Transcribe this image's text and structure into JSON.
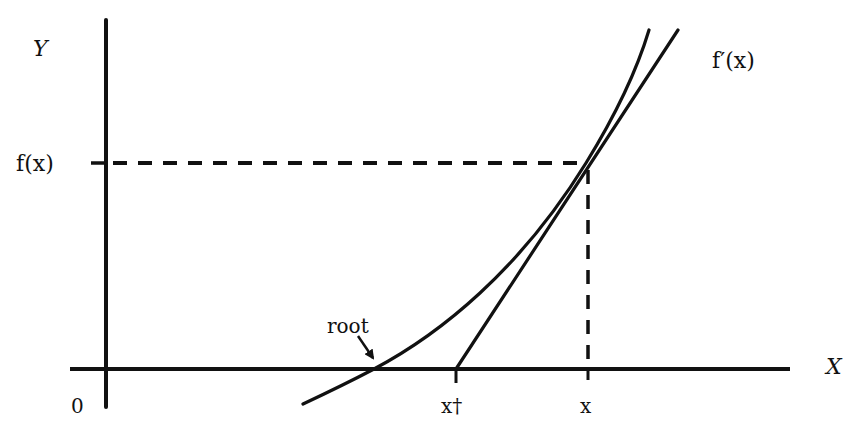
{
  "diagram": {
    "labels": {
      "y_axis": "Y",
      "x_axis": "X",
      "origin": "0",
      "fx": "f(x)",
      "derivative": "f′(x)",
      "root": "root",
      "x_dagger": "x†",
      "x": "x"
    },
    "colors": {
      "ink": "#111111",
      "background": "#ffffff"
    },
    "geometry": {
      "y_axis": {
        "x": 106,
        "y1": 20,
        "y2": 407
      },
      "x_axis": {
        "y": 369,
        "x1": 70,
        "x2": 790
      },
      "fx_level_y": 163,
      "x_position": 588,
      "x_dagger_position": 456,
      "root_position": 374,
      "tangent_point": [
        586,
        163
      ],
      "curve_points": [
        [
          303,
          404
        ],
        [
          374,
          369
        ],
        [
          470,
          306
        ],
        [
          540,
          232
        ],
        [
          586,
          163
        ],
        [
          620,
          100
        ],
        [
          649,
          30
        ]
      ],
      "tangent_line": {
        "from": [
          456,
          369
        ],
        "to": [
          678,
          30
        ]
      },
      "root_arrow": {
        "from": [
          358,
          336
        ],
        "to": [
          374,
          360
        ]
      }
    }
  }
}
